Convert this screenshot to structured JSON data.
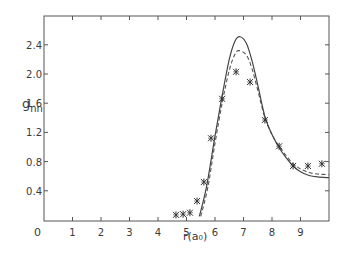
{
  "chart_data": {
    "type": "line",
    "title": "",
    "xlabel": "r(a₀)",
    "ylabel": "g_nn",
    "xlim": [
      0,
      10
    ],
    "ylim": [
      0,
      2.8
    ],
    "x_ticks": [
      0,
      1,
      2,
      3,
      4,
      5,
      6,
      7,
      8,
      9
    ],
    "x_tick_labels": [
      "0",
      "1",
      "2",
      "3",
      "4",
      "5",
      "6",
      "7",
      "8",
      "9"
    ],
    "y_ticks": [
      0.4,
      0.8,
      1.2,
      1.6,
      2.0,
      2.4
    ],
    "y_tick_labels": [
      "0.4",
      "0.8",
      "1.2",
      "1.6",
      "2.0",
      "2.4"
    ],
    "grid": false,
    "legend": null,
    "series": [
      {
        "name": "experiment",
        "style": "asterisk markers",
        "x": [
          4.63,
          4.88,
          5.12,
          5.37,
          5.61,
          5.86,
          6.25,
          6.74,
          7.23,
          7.75,
          8.25,
          8.74,
          9.26,
          9.75
        ],
        "y": [
          0.07,
          0.08,
          0.1,
          0.26,
          0.52,
          1.12,
          1.66,
          2.03,
          1.89,
          1.37,
          1.01,
          0.74,
          0.74,
          0.77
        ]
      },
      {
        "name": "theory-solid",
        "style": "solid line",
        "x": [
          5.45,
          5.7,
          6.0,
          6.25,
          6.5,
          6.7,
          6.88,
          7.1,
          7.3,
          7.5,
          7.75,
          8.0,
          8.25,
          8.5,
          8.74,
          9.0,
          9.3,
          9.6,
          10.0
        ],
        "y": [
          0.05,
          0.45,
          1.15,
          1.7,
          2.2,
          2.45,
          2.51,
          2.42,
          2.18,
          1.85,
          1.42,
          1.17,
          0.99,
          0.85,
          0.74,
          0.66,
          0.61,
          0.59,
          0.58
        ]
      },
      {
        "name": "theory-dashed",
        "style": "dashed line",
        "x": [
          5.5,
          5.75,
          6.0,
          6.25,
          6.5,
          6.7,
          6.84,
          7.1,
          7.3,
          7.5,
          7.75,
          8.0,
          8.25,
          8.5,
          8.74,
          9.0,
          9.3,
          9.6,
          10.0
        ],
        "y": [
          0.05,
          0.45,
          1.05,
          1.6,
          2.05,
          2.27,
          2.32,
          2.26,
          2.07,
          1.78,
          1.4,
          1.17,
          1.01,
          0.88,
          0.77,
          0.7,
          0.65,
          0.63,
          0.62
        ]
      }
    ]
  },
  "labels": {
    "ylabel_main": "g",
    "ylabel_sub": "nn",
    "xlabel": "r(a₀)",
    "origin": "0"
  }
}
